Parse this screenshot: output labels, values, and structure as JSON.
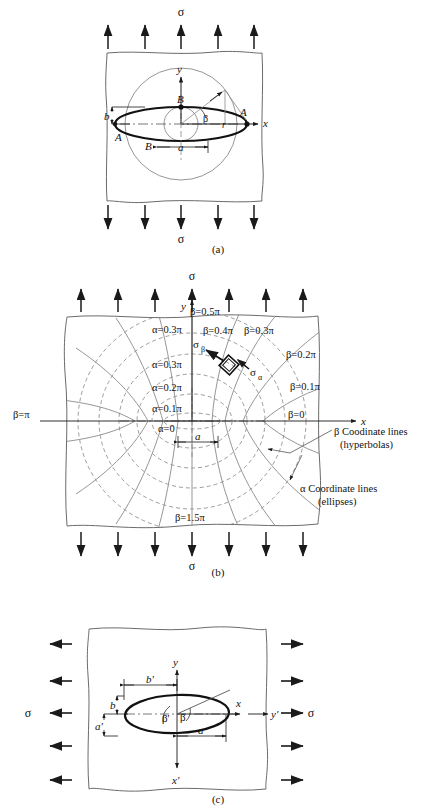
{
  "document": {
    "kind": "technical-figure",
    "subject": "Elliptical hole in a plate under far-field tension; elliptic (alpha-beta) coordinate system",
    "background_color": "#ffffff",
    "line_color": "#1a1a1a",
    "thin_line_color": "#6b6b6b",
    "dashed_line_color": "#7a7a7a"
  },
  "figures": [
    {
      "id": "a",
      "caption": "(a)",
      "load_top_label": "σ",
      "load_bottom_label": "σ",
      "arrow_count_top": 5,
      "arrow_count_bottom": 5,
      "axes": {
        "x": "x",
        "y": "y"
      },
      "labels": {
        "point_a_right": "A",
        "point_a_left": "A",
        "point_b_top": "B",
        "point_b_bottom": "B",
        "semi_major": "a",
        "semi_minor": "b",
        "radius": "r",
        "angle": "β"
      }
    },
    {
      "id": "b",
      "caption": "(b)",
      "load_top_label": "σ",
      "load_bottom_label": "σ",
      "arrow_count_top": 7,
      "arrow_count_bottom": 7,
      "axes": {
        "x": "x",
        "y": "y"
      },
      "dimension_label": "a",
      "stress_element": {
        "sigma_beta": "σ",
        "sigma_beta_sub": "β",
        "sigma_alpha": "σ",
        "sigma_alpha_sub": "α"
      },
      "alpha_labels": [
        "α=0.3π",
        "α=0.3π",
        "α=0.2π",
        "α=0.1π",
        "α=0"
      ],
      "beta_labels": [
        "β=0.5π",
        "β=0.4π",
        "β=0.3π",
        "β=0.2π",
        "β=0.1π",
        "β=0",
        "β=π",
        "β=1.5π"
      ],
      "legend": {
        "beta_line1": "β  Coodinate lines",
        "beta_line2": "(hyperbolas)",
        "alpha_line1": "α  Coordinate lines",
        "alpha_line2": "(ellipses)"
      }
    },
    {
      "id": "c",
      "caption": "(c)",
      "load_left_label": "σ",
      "load_right_label": "σ",
      "arrow_count_left": 5,
      "arrow_count_right": 5,
      "axes": {
        "x": "x",
        "y": "y",
        "x_prime": "x'",
        "y_prime": "y'"
      },
      "labels": {
        "semi_major": "a",
        "semi_minor_b": "b",
        "b_prime": "b'",
        "a_prime": "a'",
        "angle_beta": "β",
        "angle_beta_prime": "β'"
      }
    }
  ]
}
